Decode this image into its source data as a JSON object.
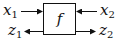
{
  "diagram": {
    "block": {
      "label": "f"
    },
    "inputs": [
      {
        "var": "x",
        "sub": "1",
        "side": "left",
        "direction": "into-block"
      },
      {
        "var": "x",
        "sub": "2",
        "side": "right",
        "direction": "into-block"
      }
    ],
    "outputs": [
      {
        "var": "z",
        "sub": "1",
        "side": "left",
        "direction": "out-of-block"
      },
      {
        "var": "z",
        "sub": "2",
        "side": "right",
        "direction": "out-of-block"
      }
    ],
    "colors": {
      "stroke": "#111111",
      "background": "#ffffff"
    }
  }
}
